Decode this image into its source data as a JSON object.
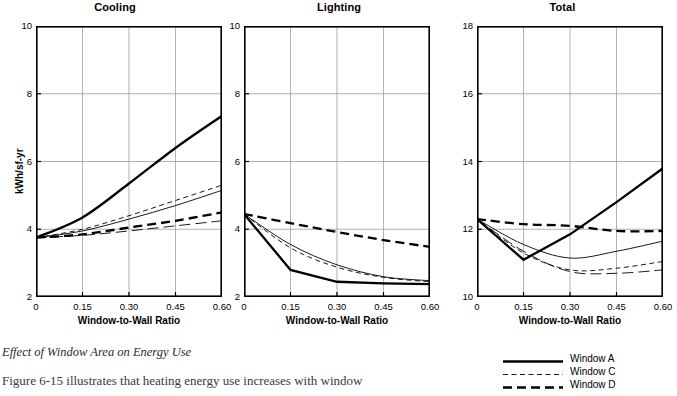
{
  "figure": {
    "ylabel": "kWh/sf-yr",
    "xlabel": "Window-to-Wall Ratio",
    "caption": "Effect of Window Area on Energy Use",
    "bodytext": "Figure 6-15 illustrates that heating energy use increases with window"
  },
  "legend": {
    "position": "bottom-right",
    "items": [
      {
        "label": "Window A",
        "style": "solid-thick"
      },
      {
        "label": "Window C",
        "style": "dashed-thin"
      },
      {
        "label": "Window D",
        "style": "dashed-thick"
      }
    ]
  },
  "chart_data": [
    {
      "type": "line",
      "title": "Cooling",
      "xlabel": "Window-to-Wall Ratio",
      "ylabel": "kWh/sf-yr",
      "x": [
        0,
        0.15,
        0.3,
        0.45,
        0.6
      ],
      "xticks": [
        "0",
        "0.15",
        "0.30",
        "0.45",
        "0.60"
      ],
      "yticks": [
        "2",
        "4",
        "6",
        "8",
        "10"
      ],
      "xlim": [
        0,
        0.6
      ],
      "ylim": [
        2,
        10
      ],
      "grid": true,
      "series": [
        {
          "name": "Window A",
          "style": "solid-thick",
          "values": [
            3.75,
            4.35,
            5.35,
            6.4,
            7.35
          ]
        },
        {
          "name": "Window B",
          "style": "solid-thin",
          "values": [
            3.75,
            3.95,
            4.3,
            4.7,
            5.15
          ]
        },
        {
          "name": "Window C",
          "style": "dashed-thin",
          "values": [
            3.75,
            4.0,
            4.4,
            4.85,
            5.3
          ]
        },
        {
          "name": "Window D",
          "style": "dashed-thick",
          "values": [
            3.75,
            3.85,
            4.05,
            4.25,
            4.5
          ]
        },
        {
          "name": "Window E",
          "style": "dashed-long-thin",
          "values": [
            3.75,
            3.82,
            3.95,
            4.1,
            4.25
          ]
        }
      ]
    },
    {
      "type": "line",
      "title": "Lighting",
      "xlabel": "Window-to-Wall Ratio",
      "ylabel": "kWh/sf-yr",
      "x": [
        0,
        0.15,
        0.3,
        0.45,
        0.6
      ],
      "xticks": [
        "0",
        "0.15",
        "0.30",
        "0.45",
        "0.60"
      ],
      "yticks": [
        "2",
        "4",
        "6",
        "8",
        "10"
      ],
      "xlim": [
        0,
        0.6
      ],
      "ylim": [
        2,
        10
      ],
      "grid": true,
      "series": [
        {
          "name": "Window A",
          "style": "solid-thick",
          "values": [
            4.45,
            2.8,
            2.45,
            2.4,
            2.38
          ]
        },
        {
          "name": "Window B",
          "style": "solid-thin",
          "values": [
            4.45,
            3.55,
            2.95,
            2.6,
            2.48
          ]
        },
        {
          "name": "Window C",
          "style": "dashed-thin",
          "values": [
            4.45,
            3.45,
            2.88,
            2.58,
            2.45
          ]
        },
        {
          "name": "Window D",
          "style": "dashed-thick",
          "values": [
            4.45,
            4.18,
            3.92,
            3.68,
            3.48
          ]
        }
      ]
    },
    {
      "type": "line",
      "title": "Total",
      "xlabel": "Window-to-Wall Ratio",
      "ylabel": "kWh/sf-yr",
      "x": [
        0,
        0.15,
        0.3,
        0.45,
        0.6
      ],
      "xticks": [
        "0",
        "0.15",
        "0.30",
        "0.45",
        "0.60"
      ],
      "yticks": [
        "10",
        "12",
        "14",
        "16",
        "18"
      ],
      "xlim": [
        0,
        0.6
      ],
      "ylim": [
        10,
        18
      ],
      "grid": true,
      "series": [
        {
          "name": "Window A",
          "style": "solid-thick",
          "values": [
            12.3,
            11.1,
            11.85,
            12.8,
            13.8
          ]
        },
        {
          "name": "Window B",
          "style": "solid-thin",
          "values": [
            12.3,
            11.55,
            11.15,
            11.35,
            11.65
          ]
        },
        {
          "name": "Window C",
          "style": "dashed-thin",
          "values": [
            12.3,
            11.3,
            10.8,
            10.85,
            11.05
          ]
        },
        {
          "name": "Window D",
          "style": "dashed-thick",
          "values": [
            12.3,
            12.15,
            12.1,
            11.95,
            11.95
          ]
        },
        {
          "name": "Window E",
          "style": "dashed-long-thin",
          "values": [
            12.3,
            11.35,
            10.75,
            10.7,
            10.8
          ]
        }
      ]
    }
  ]
}
